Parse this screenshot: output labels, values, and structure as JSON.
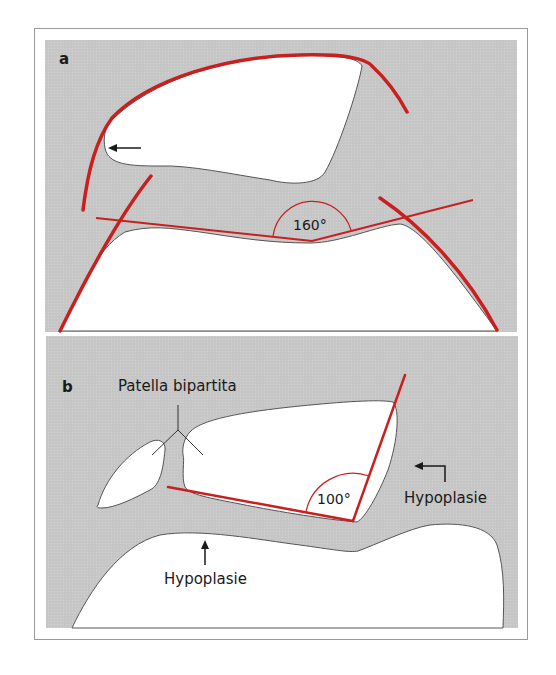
{
  "figure": {
    "colors": {
      "panel_background": "#c8c8c8",
      "bone_fill": "#ffffff",
      "bone_outline": "#555555",
      "measurement_line": "#c8201e",
      "text": "#1a1a1a",
      "frame_border": "#9a9a9a"
    },
    "panel_a": {
      "label": "a",
      "angle_label": "160°",
      "arrow_icon": "left-arrow"
    },
    "panel_b": {
      "label": "b",
      "annotation_bipartita": "Patella bipartita",
      "angle_label": "100°",
      "annotation_hypoplasie_right": "Hypoplasie",
      "annotation_hypoplasie_bottom": "Hypoplasie",
      "arrow_right_icon": "corner-left-arrow",
      "arrow_bottom_icon": "up-arrow"
    }
  }
}
